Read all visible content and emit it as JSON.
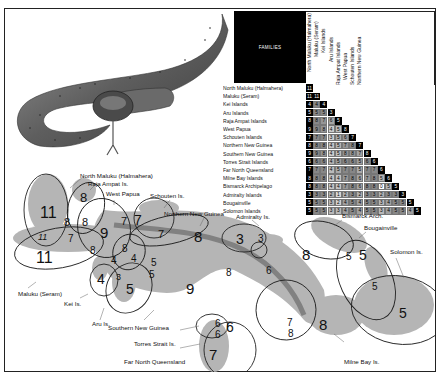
{
  "matrix": {
    "header": "FAMILIES",
    "regions": [
      "North Maluku (Halmahera)",
      "Maluku (Seram)",
      "Kei Islands",
      "Aru Islands",
      "Raja Ampat Islands",
      "West Papua",
      "Schouten Islands",
      "Northern New Guinea",
      "Southern New Guinea",
      "Torres Strait Islands",
      "Far North Queensland",
      "Milne Bay Islands",
      "Bismarck Archipelago",
      "Admiralty Islands",
      "Bougainville",
      "Solomon Islands"
    ],
    "rows": [
      [
        11
      ],
      [
        11,
        11
      ],
      [
        4,
        4,
        4
      ],
      [
        5,
        5,
        5,
        3
      ],
      [
        8,
        8,
        7,
        6,
        5
      ],
      [
        9,
        9,
        8,
        4,
        5,
        8
      ],
      [
        7,
        7,
        7,
        3,
        5,
        6,
        7
      ],
      [
        8,
        8,
        8,
        4,
        5,
        7,
        8,
        7
      ],
      [
        9,
        9,
        8,
        4,
        5,
        8,
        8,
        7,
        8
      ],
      [
        6,
        6,
        6,
        4,
        5,
        6,
        6,
        5,
        6,
        6
      ],
      [
        7,
        7,
        7,
        4,
        5,
        7,
        7,
        5,
        7,
        7,
        6
      ],
      [
        8,
        8,
        8,
        4,
        4,
        7,
        8,
        6,
        7,
        8,
        5,
        6
      ],
      [
        8,
        8,
        8,
        4,
        4,
        7,
        8,
        6,
        8,
        8,
        0,
        5,
        5
      ],
      [
        3,
        3,
        3,
        2,
        1,
        2,
        3,
        2,
        3,
        3,
        2,
        3,
        3,
        3
      ],
      [
        5,
        5,
        5,
        3,
        2,
        4,
        5,
        4,
        5,
        5,
        3,
        4,
        5,
        5,
        5
      ],
      [
        5,
        5,
        5,
        3,
        3,
        4,
        5,
        4,
        5,
        5,
        3,
        4,
        5,
        5,
        4,
        5
      ]
    ]
  },
  "map": {
    "labels": {
      "north_maluku": "North Maluku (Halmahera)",
      "raja_ampat": "Raja Ampat Is.",
      "west_papua": "West Papua",
      "schouten": "Schouten Is.",
      "northern_ng": "Northern New Guinea",
      "admiralty": "Admiralty Is.",
      "bismarck": "Bismarck Arch.",
      "bougainville": "Bougainville",
      "solomon": "Solomon Is.",
      "maluku_seram": "Maluku  (Seram)",
      "kei": "Kei Is.",
      "aru": "Aru Is.",
      "southern_ng": "Southern New Guinea",
      "torres": "Torres Strait Is.",
      "fnq": "Far North Queensland",
      "milne_bay": "Milne Bay Is."
    },
    "numbers": {
      "halmahera": "11",
      "halmahera_seram": "11",
      "halmahera_raja": "8",
      "raja": "8",
      "raja_halm": "7",
      "raja_wp": "8",
      "seram": "11",
      "wp": "9",
      "wp_kei": "8",
      "wp_schouten": "7",
      "schouten": "7",
      "schouten_nng": "7",
      "wp_nng": "8",
      "kei_aru_a": "4",
      "kei_aru_b": "4",
      "kei": "4",
      "aru_kei": "3",
      "aru": "5",
      "aru_nng_a": "5",
      "aru_nng_b": "5",
      "nng": "8",
      "sng": "9",
      "sng_nng": "8",
      "admiralty": "3",
      "adm_bis": "3",
      "bismarck": "8",
      "bis_nng": "6",
      "bis_boug": "5",
      "boug": "5",
      "boug_sol": "5",
      "sol": "5",
      "torres_a": "6",
      "torres": "6",
      "torres_b": "6",
      "fnq": "7",
      "milne_nng": "7",
      "milne_sng": "8",
      "milne": "8"
    }
  }
}
